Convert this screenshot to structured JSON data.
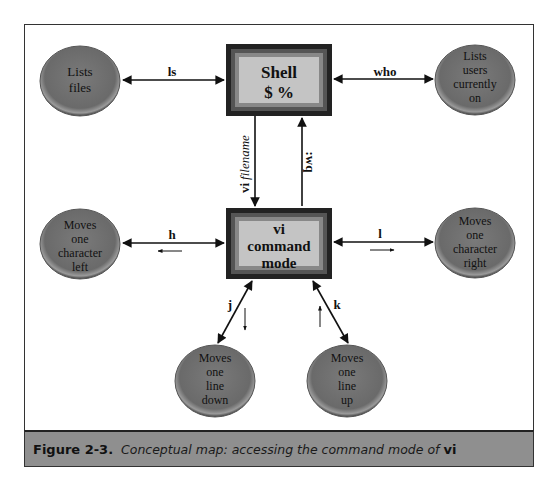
{
  "diagram": {
    "boxes": {
      "shell": {
        "lines": [
          "Shell",
          "$ %"
        ]
      },
      "vi": {
        "lines": [
          "vi",
          "command",
          "mode"
        ]
      }
    },
    "nodes": {
      "ls_node": {
        "lines": [
          "Lists",
          "files"
        ]
      },
      "who_node": {
        "lines": [
          "Lists",
          "users",
          "currently",
          "on"
        ]
      },
      "h_node": {
        "lines": [
          "Moves",
          "one",
          "character",
          "left"
        ]
      },
      "l_node": {
        "lines": [
          "Moves",
          "one",
          "character",
          "right"
        ]
      },
      "j_node": {
        "lines": [
          "Moves",
          "one",
          "line",
          "down"
        ]
      },
      "k_node": {
        "lines": [
          "Moves",
          "one",
          "line",
          "up"
        ]
      }
    },
    "edges": {
      "ls": {
        "label": "ls"
      },
      "who": {
        "label": "who"
      },
      "vi_filename": {
        "label_bold": "vi",
        "label_italic": "filename"
      },
      "wq": {
        "label": ":wq"
      },
      "h": {
        "label": "h",
        "direction_hint": "left"
      },
      "l": {
        "label": "l",
        "direction_hint": "right"
      },
      "j": {
        "label": "j",
        "direction_hint": "down"
      },
      "k": {
        "label": "k",
        "direction_hint": "up"
      }
    }
  },
  "caption": {
    "label": "Figure 2-3.",
    "text": "Conceptual map: accessing the command mode of ",
    "emphasis": "vi"
  },
  "colors": {
    "node_fill": "#6e6e6e",
    "box_outer": "#2a2a2a",
    "box_inner": "#c4c4c4",
    "caption_bar": "#8f8f8f"
  }
}
